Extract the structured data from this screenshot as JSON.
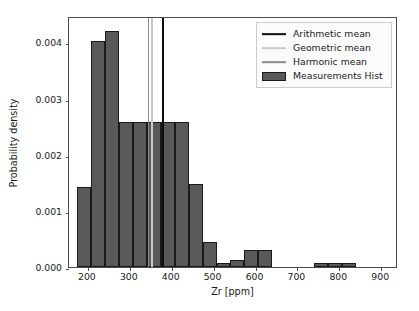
{
  "chart_data": {
    "type": "bar",
    "title": "",
    "subtitle": "",
    "xlabel": "Zr [ppm]",
    "ylabel": "Probability density",
    "xlim": [
      155,
      940
    ],
    "ylim": [
      0.0,
      0.00447
    ],
    "grid": false,
    "legend_position": "upper right",
    "xticks": [
      200,
      300,
      400,
      500,
      600,
      700,
      800,
      900
    ],
    "xtick_labels": [
      "200",
      "300",
      "400",
      "500",
      "600",
      "700",
      "800",
      "900"
    ],
    "yticks": [
      0.0,
      0.001,
      0.002,
      0.003,
      0.004
    ],
    "ytick_labels": [
      "0.000",
      "0.001",
      "0.002",
      "0.003",
      "0.004"
    ],
    "histogram": {
      "name": "Measurements Hist",
      "color": "#595959",
      "edge_color": "#1a1a1a",
      "bin_width": 33.2,
      "bin_edges": [
        175.0,
        208.2,
        241.4,
        274.6,
        307.8,
        341.0,
        374.2,
        407.4,
        440.6,
        473.8,
        507.0,
        540.2,
        573.4,
        606.6,
        639.8,
        673.0,
        706.2,
        739.4,
        772.6,
        805.8,
        839.0,
        872.2,
        905.4,
        938.6
      ],
      "bin_centers": [
        191.6,
        224.8,
        258.0,
        291.2,
        324.4,
        357.6,
        390.8,
        424.0,
        457.2,
        490.4,
        523.6,
        556.8,
        590.0,
        623.2,
        656.4,
        689.6,
        722.8,
        756.0,
        789.2,
        822.4,
        855.6,
        888.8,
        922.0
      ],
      "values": [
        0.00143,
        0.00402,
        0.0042,
        0.00258,
        0.00258,
        0.00258,
        0.00258,
        0.00258,
        0.00148,
        0.00045,
        7e-05,
        0.00013,
        0.0003,
        0.0003,
        0.0,
        0.0,
        0.0,
        7e-05,
        7e-05,
        7e-05,
        0.0,
        0.0,
        0.0
      ]
    },
    "vlines": [
      {
        "name": "Arithmetic mean",
        "x": 380,
        "color": "#0d0d0d"
      },
      {
        "name": "Geometric mean",
        "x": 353,
        "color": "#c8c8c8"
      },
      {
        "name": "Harmonic mean",
        "x": 345,
        "color": "#8c8c8c"
      }
    ],
    "legend_entries": [
      {
        "label": "Arithmetic mean",
        "marker": "line",
        "color": "#0d0d0d"
      },
      {
        "label": "Geometric mean",
        "marker": "line",
        "color": "#c8c8c8"
      },
      {
        "label": "Harmonic mean",
        "marker": "line",
        "color": "#8c8c8c"
      },
      {
        "label": "Measurements Hist",
        "marker": "patch",
        "color": "#595959"
      }
    ]
  }
}
